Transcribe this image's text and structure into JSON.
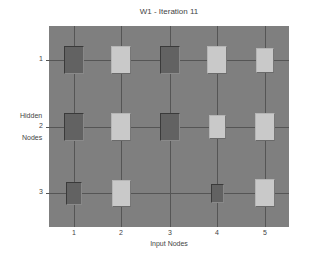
{
  "chart_data": {
    "type": "heatmap",
    "subtype": "hinton",
    "title": "W1 - Iteration 11",
    "xlabel": "Input Nodes",
    "ylabel": [
      "Hidden",
      "Nodes"
    ],
    "x_ticks": [
      "1",
      "2",
      "3",
      "4",
      "5"
    ],
    "y_ticks": [
      "1",
      "2",
      "3"
    ],
    "grid": true,
    "encoding": "box size = |weight|, light = positive, dark = negative",
    "rows": [
      {
        "hidden_node": 1,
        "weights": [
          -1.0,
          1.0,
          -1.0,
          1.0,
          0.8
        ]
      },
      {
        "hidden_node": 2,
        "weights": [
          -1.0,
          1.0,
          -1.0,
          0.75,
          1.0
        ]
      },
      {
        "hidden_node": 3,
        "weights": [
          -0.65,
          0.9,
          0.0,
          -0.45,
          1.0
        ]
      }
    ]
  },
  "colors": {
    "plot_background": "#7f7f7f",
    "positive_box": "#c9c9c9",
    "negative_box": "#626262",
    "grid": "#555555"
  }
}
